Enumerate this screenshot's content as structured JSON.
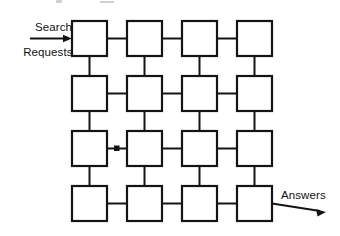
{
  "diagram": {
    "type": "mesh-network",
    "background_color": "#ffffff",
    "line_color": "#141414",
    "grid": {
      "rows": 4,
      "columns": 4,
      "node_count": 16,
      "node_width": 35,
      "node_height": 35,
      "horizontal_gap": 20,
      "vertical_gap": 20,
      "origin_x": 72,
      "origin_y": 21
    },
    "nodes": [
      {
        "row": 0,
        "col": 0,
        "label": ""
      },
      {
        "row": 0,
        "col": 1,
        "label": ""
      },
      {
        "row": 0,
        "col": 2,
        "label": ""
      },
      {
        "row": 0,
        "col": 3,
        "label": ""
      },
      {
        "row": 1,
        "col": 0,
        "label": ""
      },
      {
        "row": 1,
        "col": 1,
        "label": ""
      },
      {
        "row": 1,
        "col": 2,
        "label": ""
      },
      {
        "row": 1,
        "col": 3,
        "label": ""
      },
      {
        "row": 2,
        "col": 0,
        "label": ""
      },
      {
        "row": 2,
        "col": 1,
        "label": ""
      },
      {
        "row": 2,
        "col": 2,
        "label": ""
      },
      {
        "row": 2,
        "col": 3,
        "label": ""
      },
      {
        "row": 3,
        "col": 0,
        "label": ""
      },
      {
        "row": 3,
        "col": 1,
        "label": ""
      },
      {
        "row": 3,
        "col": 2,
        "label": ""
      },
      {
        "row": 3,
        "col": 3,
        "label": ""
      }
    ],
    "input": {
      "label_line_1": "Search",
      "label_line_2": "Requests",
      "label_text": "Search\nRequests",
      "direction": "right",
      "target_row": 0,
      "target_col": 0
    },
    "output": {
      "label_text": "Answers",
      "direction": "right",
      "source_row": 3,
      "source_col": 3
    },
    "annotations": {
      "midpoint_marker_row": 2,
      "midpoint_marker_between_cols": "0-1"
    }
  }
}
